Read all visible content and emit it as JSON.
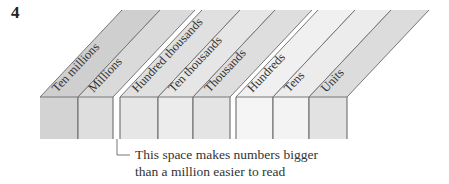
{
  "figure": {
    "number": "4",
    "columns": [
      {
        "label": "Ten millions",
        "x0": 40,
        "x1": 78,
        "front": "#d3d3d3",
        "top": "#cfcfcf"
      },
      {
        "label": "Millions",
        "x0": 78,
        "x1": 113,
        "front": "#dedede",
        "top": "#dadada"
      },
      {
        "label": "Hundred thousands",
        "x0": 120,
        "x1": 158,
        "front": "#e6e6e6",
        "top": "#e0e0e0"
      },
      {
        "label": "Ten thousands",
        "x0": 158,
        "x1": 193,
        "front": "#ececec",
        "top": "#e6e6e6"
      },
      {
        "label": "Thousands",
        "x0": 193,
        "x1": 230,
        "front": "#e4e4e4",
        "top": "#dedede"
      },
      {
        "label": "Hundreds",
        "x0": 236,
        "x1": 273,
        "front": "#f5f5f5",
        "top": "#f0f0f0"
      },
      {
        "label": "Tens",
        "x0": 273,
        "x1": 309,
        "front": "#f3f3f3",
        "top": "#ececec"
      },
      {
        "label": "Units",
        "x0": 309,
        "x1": 347,
        "front": "#e2e2e2",
        "top": "#dcdcdc"
      }
    ],
    "annotation": {
      "line1": "This space makes numbers bigger",
      "line2": "than a million easier to read"
    },
    "colors": {
      "edge": "#777777",
      "text": "#333333"
    }
  }
}
